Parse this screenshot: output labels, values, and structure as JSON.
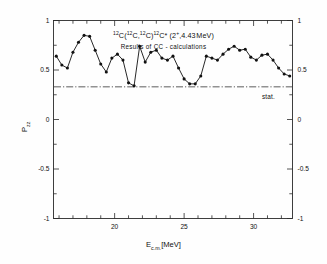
{
  "chart_data": {
    "type": "line",
    "subtitle": "Results of CC - calculations",
    "xlabel": "E_c.m.[MeV]",
    "ylabel": "P_zz",
    "xlim": [
      15.6,
      32.8
    ],
    "ylim": [
      -1,
      1
    ],
    "xticks": [
      20,
      25,
      30
    ],
    "xtick_labels": [
      "20",
      "25",
      "30"
    ],
    "yticks": [
      -1,
      -0.5,
      0,
      0.5,
      1
    ],
    "ytick_labels": [
      "-1",
      "-0.5",
      "0",
      "0.5",
      "1"
    ],
    "x_minor_step": 1,
    "y_minor_step": 0.25,
    "grid": false,
    "legend": "none",
    "marker": "filled-circle",
    "line_color": "#111111",
    "annotations": [
      {
        "text": "stat.",
        "x": 31.0,
        "y": 0.22,
        "name": "statistical-limit-label"
      }
    ],
    "reference_line": {
      "name": "statistical-limit-line",
      "style": "dash-dot",
      "y": 0.33,
      "color": "#333333"
    },
    "x": [
      15.8,
      16.2,
      16.6,
      17.0,
      17.4,
      17.8,
      18.2,
      18.6,
      19.0,
      19.4,
      19.8,
      20.2,
      20.6,
      21.0,
      21.4,
      21.8,
      22.2,
      22.6,
      23.0,
      23.4,
      23.8,
      24.2,
      24.6,
      25.0,
      25.4,
      25.8,
      26.2,
      26.6,
      27.0,
      27.4,
      27.8,
      28.2,
      28.6,
      29.0,
      29.4,
      29.8,
      30.2,
      30.6,
      31.0,
      31.4,
      31.8,
      32.2,
      32.6
    ],
    "values": [
      0.64,
      0.55,
      0.52,
      0.68,
      0.78,
      0.85,
      0.84,
      0.7,
      0.56,
      0.48,
      0.62,
      0.66,
      0.6,
      0.37,
      0.34,
      0.74,
      0.58,
      0.68,
      0.7,
      0.62,
      0.6,
      0.64,
      0.52,
      0.41,
      0.36,
      0.36,
      0.44,
      0.64,
      0.62,
      0.6,
      0.66,
      0.71,
      0.74,
      0.7,
      0.71,
      0.63,
      0.6,
      0.65,
      0.66,
      0.6,
      0.52,
      0.46,
      0.44
    ],
    "series_note": "tensor polarization P_zz versus center-of-mass energy"
  },
  "xaxis_title": {
    "main": "E",
    "sub": "c.m.",
    "unit": "[MeV]"
  },
  "yaxis_title": {
    "main": "P",
    "sub": "zz"
  }
}
